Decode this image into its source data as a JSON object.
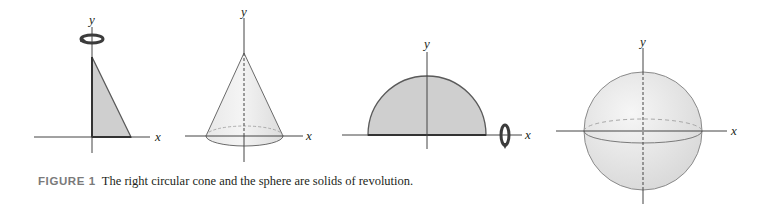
{
  "figure": {
    "label": "FIGURE 1",
    "caption": "The right circular cone and the sphere are solids of revolution."
  },
  "panels": [
    {
      "name": "triangle-region",
      "x_label": "x",
      "y_label": "y",
      "rotation": "about y-axis"
    },
    {
      "name": "right-circular-cone",
      "x_label": "x",
      "y_label": "y"
    },
    {
      "name": "semicircle-region",
      "x_label": "x",
      "y_label": "y",
      "rotation": "about x-axis"
    },
    {
      "name": "sphere",
      "x_label": "x",
      "y_label": "y"
    }
  ],
  "colors": {
    "region_fill": "#cfcfcf",
    "solid_fill": "#e6e6e6",
    "outline": "#5a5a5a",
    "arrow": "#3c3c3c",
    "axis": "#444444"
  }
}
